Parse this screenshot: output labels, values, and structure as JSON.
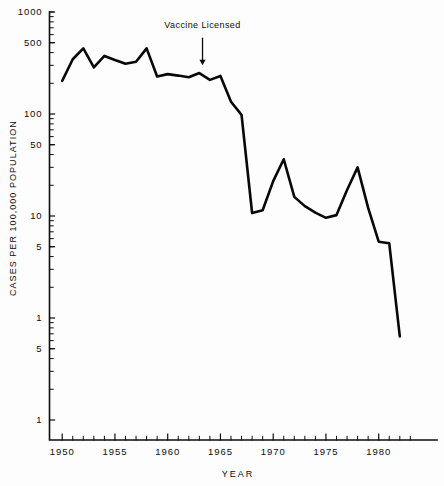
{
  "chart_data": {
    "type": "line",
    "title": "",
    "xlabel": "YEAR",
    "ylabel": "CASES PER 100,000 POPULATION",
    "yscale": "log",
    "ylim": [
      0.1,
      1000
    ],
    "xlim": [
      1949.2,
      1983.6
    ],
    "grid": false,
    "legend": null,
    "y_tick_labels": [
      "1000",
      "500",
      "100",
      "50",
      "10",
      "5",
      "1",
      "5",
      "1"
    ],
    "y_tick_values": [
      1000,
      500,
      100,
      50,
      10,
      5,
      1,
      0.5,
      0.1
    ],
    "x_tick_labels": [
      "1950",
      "1955",
      "1960",
      "1965",
      "1970",
      "1975",
      "1980"
    ],
    "x_tick_values": [
      1950,
      1955,
      1960,
      1965,
      1970,
      1975,
      1980
    ],
    "annotations": [
      {
        "text": "Vaccine Licensed",
        "x": 1963.3,
        "label_y": 700,
        "arrow_from_y": 560,
        "arrow_to_y": 300
      }
    ],
    "series": [
      {
        "name": "Measles incidence",
        "x": [
          1950,
          1951,
          1952,
          1953,
          1954,
          1955,
          1956,
          1957,
          1958,
          1959,
          1960,
          1961,
          1962,
          1963,
          1964,
          1965,
          1966,
          1967,
          1968,
          1969,
          1970,
          1971,
          1972,
          1973,
          1974,
          1975,
          1976,
          1977,
          1978,
          1979,
          1980,
          1981,
          1982
        ],
        "values": [
          211,
          344,
          440,
          286,
          371,
          338,
          311,
          325,
          440,
          233,
          246,
          238,
          229,
          252,
          216,
          236,
          132,
          98,
          10.7,
          11.4,
          22.0,
          36.0,
          15.4,
          12.5,
          10.8,
          9.6,
          10.2,
          18.0,
          30.0,
          12.0,
          5.6,
          5.4,
          0.66
        ]
      }
    ]
  },
  "figure": {
    "axis_color": "#0d0d0d",
    "line_color": "#080808",
    "background": "#fdfdfd"
  }
}
